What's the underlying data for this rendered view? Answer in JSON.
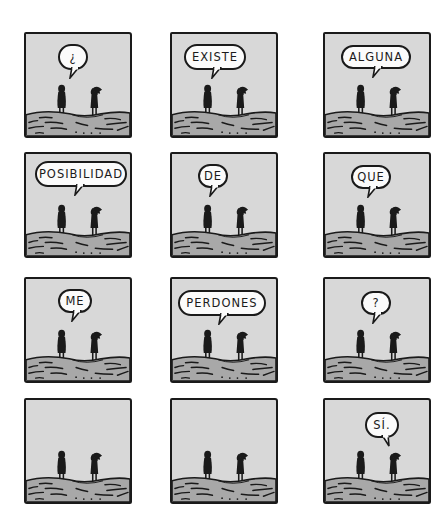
{
  "comic": {
    "colors": {
      "background": "#ffffff",
      "sky": "#d8d8d8",
      "ground": "#a8a8a8",
      "ink": "#1a1a1a",
      "bubble": "#fbfbfb"
    },
    "panels": [
      {
        "row": 1,
        "col": 1,
        "speech": "¿",
        "speaker": "left"
      },
      {
        "row": 1,
        "col": 2,
        "speech": "EXISTE",
        "speaker": "left"
      },
      {
        "row": 1,
        "col": 3,
        "speech": "ALGUNA",
        "speaker": "left"
      },
      {
        "row": 2,
        "col": 1,
        "speech": "POSIBILIDAD",
        "speaker": "left"
      },
      {
        "row": 2,
        "col": 2,
        "speech": "DE",
        "speaker": "left"
      },
      {
        "row": 2,
        "col": 3,
        "speech": "QUE",
        "speaker": "left"
      },
      {
        "row": 3,
        "col": 1,
        "speech": "ME",
        "speaker": "left"
      },
      {
        "row": 3,
        "col": 2,
        "speech": "PERDONES",
        "speaker": "left"
      },
      {
        "row": 3,
        "col": 3,
        "speech": "?",
        "speaker": "left"
      },
      {
        "row": 4,
        "col": 1,
        "speech": "",
        "speaker": ""
      },
      {
        "row": 4,
        "col": 2,
        "speech": "",
        "speaker": ""
      },
      {
        "row": 4,
        "col": 3,
        "speech": "SÍ.",
        "speaker": "right"
      }
    ]
  }
}
